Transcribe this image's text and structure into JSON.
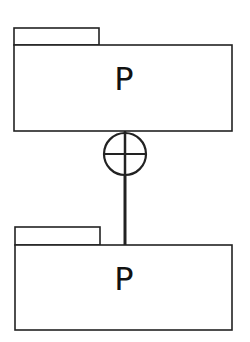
{
  "diagram": {
    "type": "uml-package-containment",
    "colors": {
      "stroke": "#222222",
      "background": "#ffffff",
      "text": "#111111"
    },
    "packages": [
      {
        "id": "top",
        "label": "P",
        "role": "container"
      },
      {
        "id": "bottom",
        "label": "P",
        "role": "nested"
      }
    ],
    "connector": {
      "type": "containment",
      "symbol": "circle-plus-icon",
      "from": "bottom",
      "to": "top"
    }
  }
}
